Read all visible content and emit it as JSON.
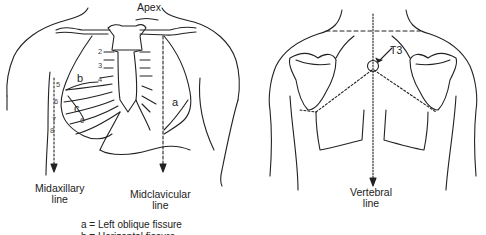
{
  "figure": {
    "anterior_view": {
      "labels": {
        "apex": "Apex",
        "midaxillary": [
          "Midaxillary",
          "line"
        ],
        "midclavicular": [
          "Midclavicular",
          "line"
        ]
      },
      "rib_numbers": [
        "2",
        "3",
        "4",
        "5",
        "6",
        "6",
        "7",
        "8"
      ],
      "fissure_letters": [
        "a",
        "b",
        "c"
      ]
    },
    "posterior_view": {
      "labels": {
        "t3": "T3",
        "vertebral": [
          "Vertebral",
          "line"
        ]
      }
    },
    "legend": [
      "a = Left oblique fissure",
      "b = Horizontal fissure"
    ]
  }
}
